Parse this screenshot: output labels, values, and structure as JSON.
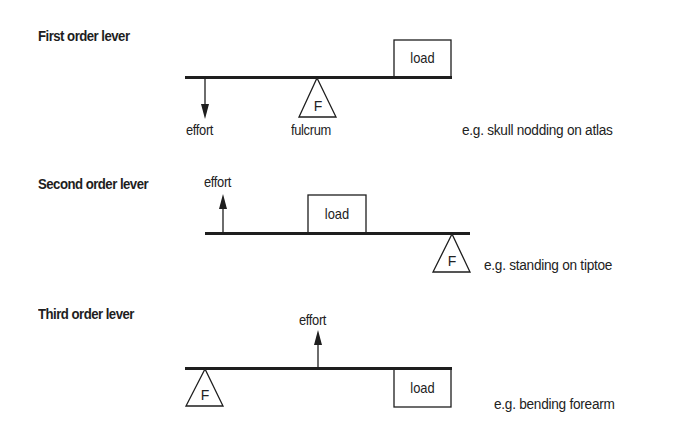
{
  "diagram": {
    "levers": [
      {
        "title": "First order lever",
        "effort_label": "effort",
        "effort_direction": "down",
        "fulcrum_symbol": "F",
        "fulcrum_label": "fulcrum",
        "load_label": "load",
        "load_position": "above-bar-right",
        "example": "e.g. skull nodding on atlas",
        "order": "effort-fulcrum-load"
      },
      {
        "title": "Second order lever",
        "effort_label": "effort",
        "effort_direction": "up",
        "fulcrum_symbol": "F",
        "load_label": "load",
        "load_position": "above-bar-middle",
        "example": "e.g. standing on tiptoe",
        "order": "effort-load-fulcrum"
      },
      {
        "title": "Third order lever",
        "effort_label": "effort",
        "effort_direction": "up",
        "fulcrum_symbol": "F",
        "load_label": "load",
        "load_position": "below-bar-right",
        "example": "e.g. bending forearm",
        "order": "fulcrum-effort-load"
      }
    ],
    "colors": {
      "ink": "#1e1e1e",
      "background": "#ffffff"
    }
  }
}
